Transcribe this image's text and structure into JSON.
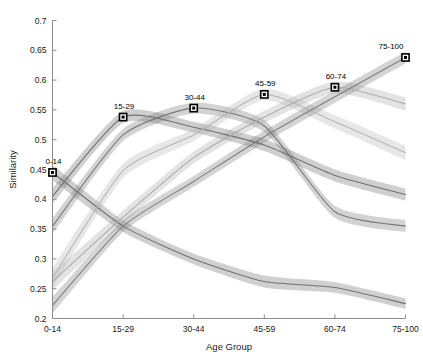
{
  "chart_data": {
    "type": "line",
    "title": "",
    "xlabel": "Age Group",
    "ylabel": "Similarity",
    "categories": [
      "0-14",
      "15-29",
      "30-44",
      "45-59",
      "60-74",
      "75-100"
    ],
    "x_tick_labels": [
      "0-14",
      "15-29",
      "30-44",
      "45-59",
      "60-74",
      "75-100"
    ],
    "y_tick_labels": [
      "0.2",
      "0.25",
      "0.3",
      "0.35",
      "0.4",
      "0.45",
      "0.5",
      "0.55",
      "0.6",
      "0.65",
      "0.7"
    ],
    "y_ticks": [
      0.2,
      0.25,
      0.3,
      0.35,
      0.4,
      0.45,
      0.5,
      0.55,
      0.6,
      0.65,
      0.7
    ],
    "ylim": [
      0.2,
      0.7
    ],
    "xlim": [
      0,
      5
    ],
    "grid": false,
    "legend": "none",
    "annotations": [
      {
        "label": "0-14",
        "x": "0-14",
        "y": 0.445
      },
      {
        "label": "15-29",
        "x": "15-29",
        "y": 0.538
      },
      {
        "label": "30-44",
        "x": "30-44",
        "y": 0.553
      },
      {
        "label": "45-59",
        "x": "45-59",
        "y": 0.576
      },
      {
        "label": "60-74",
        "x": "60-74",
        "y": 0.588
      },
      {
        "label": "75-100",
        "x": "75-100",
        "y": 0.638
      }
    ],
    "series": [
      {
        "name": "0-14",
        "peak_category": "0-14",
        "color": "#6e6e6e",
        "values": [
          0.445,
          0.355,
          0.3,
          0.262,
          0.252,
          0.225
        ],
        "lower": [
          0.432,
          0.345,
          0.291,
          0.252,
          0.243,
          0.216
        ],
        "upper": [
          0.458,
          0.365,
          0.309,
          0.272,
          0.261,
          0.234
        ]
      },
      {
        "name": "15-29",
        "peak_category": "15-29",
        "color": "#6b6b6b",
        "values": [
          0.405,
          0.538,
          0.521,
          0.491,
          0.44,
          0.408
        ],
        "lower": [
          0.392,
          0.528,
          0.512,
          0.481,
          0.43,
          0.398
        ],
        "upper": [
          0.418,
          0.548,
          0.53,
          0.501,
          0.45,
          0.418
        ]
      },
      {
        "name": "30-44",
        "peak_category": "30-44",
        "color": "#757575",
        "values": [
          0.355,
          0.508,
          0.553,
          0.523,
          0.379,
          0.355
        ],
        "lower": [
          0.342,
          0.498,
          0.544,
          0.513,
          0.369,
          0.345
        ],
        "upper": [
          0.368,
          0.518,
          0.562,
          0.533,
          0.389,
          0.365
        ]
      },
      {
        "name": "45-59",
        "peak_category": "45-59",
        "color": "#b4b4b4",
        "values": [
          0.268,
          0.448,
          0.508,
          0.576,
          0.53,
          0.478
        ],
        "lower": [
          0.252,
          0.436,
          0.498,
          0.566,
          0.519,
          0.466
        ],
        "upper": [
          0.284,
          0.46,
          0.518,
          0.586,
          0.541,
          0.49
        ]
      },
      {
        "name": "60-74",
        "peak_category": "60-74",
        "color": "#a8a8a8",
        "values": [
          0.262,
          0.37,
          0.47,
          0.538,
          0.588,
          0.56
        ],
        "lower": [
          0.247,
          0.359,
          0.46,
          0.528,
          0.578,
          0.549
        ],
        "upper": [
          0.277,
          0.381,
          0.48,
          0.548,
          0.598,
          0.571
        ]
      },
      {
        "name": "75-100",
        "peak_category": "75-100",
        "color": "#7a7a7a",
        "values": [
          0.222,
          0.355,
          0.43,
          0.505,
          0.572,
          0.638
        ],
        "lower": [
          0.208,
          0.345,
          0.421,
          0.495,
          0.562,
          0.628
        ],
        "upper": [
          0.236,
          0.365,
          0.439,
          0.515,
          0.582,
          0.648
        ]
      }
    ]
  }
}
